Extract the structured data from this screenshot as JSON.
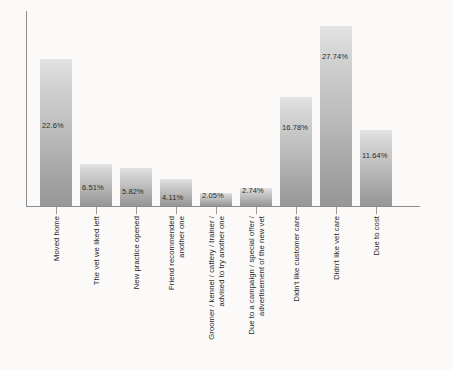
{
  "chart_data": {
    "type": "bar",
    "title": "",
    "subtitle": "",
    "xlabel": "",
    "ylabel": "",
    "grid": false,
    "legend": false,
    "ylim": [
      0,
      30
    ],
    "categories": [
      "Moved home",
      "The vet we liked left",
      "New practice opened",
      "Friend recommended another one",
      "Groomer / kennel / cattery / trainer / advised to try another one",
      "Due to a campaign / special offer / advertisement of the new vet",
      "Didn't like customer care",
      "Didn't like vet care",
      "Due to cost"
    ],
    "category_lines": [
      [
        "Moved home"
      ],
      [
        "The vet we liked left"
      ],
      [
        "New practice opened"
      ],
      [
        "Friend recommended",
        "another one"
      ],
      [
        "Groomer / kennel / cattery / trainer /",
        "advised to try another one"
      ],
      [
        "Due to a campaign / special offer /",
        "advertisement of the new vet"
      ],
      [
        "Didn't like customer care"
      ],
      [
        "Didn't like vet care"
      ],
      [
        "Due to cost"
      ]
    ],
    "values": [
      22.6,
      6.51,
      5.82,
      4.11,
      2.05,
      2.74,
      16.78,
      27.74,
      11.64
    ],
    "value_labels": [
      "22.6%",
      "6.51%",
      "5.82%",
      "4.11%",
      "2.05%",
      "2.74%",
      "16.78%",
      "27.74%",
      "11.64%"
    ],
    "colors": {
      "bar_top": "#e3e3e3",
      "bar_bottom": "#979797",
      "axis": "#8d8d8d",
      "text": "#1f1f1f",
      "background": "#fbfaf8"
    }
  }
}
